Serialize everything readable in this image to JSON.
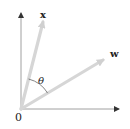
{
  "diagram": {
    "origin_label": "0",
    "vectors": [
      {
        "name": "x",
        "label": "x",
        "from": [
          21,
          109
        ],
        "to": [
          44,
          18
        ],
        "color": "#d4d4d4"
      },
      {
        "name": "w",
        "label": "w",
        "from": [
          21,
          109
        ],
        "to": [
          106,
          58
        ],
        "color": "#d4d4d4"
      }
    ],
    "angle_label": "θ",
    "axes": {
      "color": "#777777",
      "x_axis": {
        "from": [
          21,
          109
        ],
        "to": [
          120,
          109
        ]
      },
      "y_axis": {
        "from": [
          21,
          109
        ],
        "to": [
          21,
          12
        ]
      }
    }
  }
}
